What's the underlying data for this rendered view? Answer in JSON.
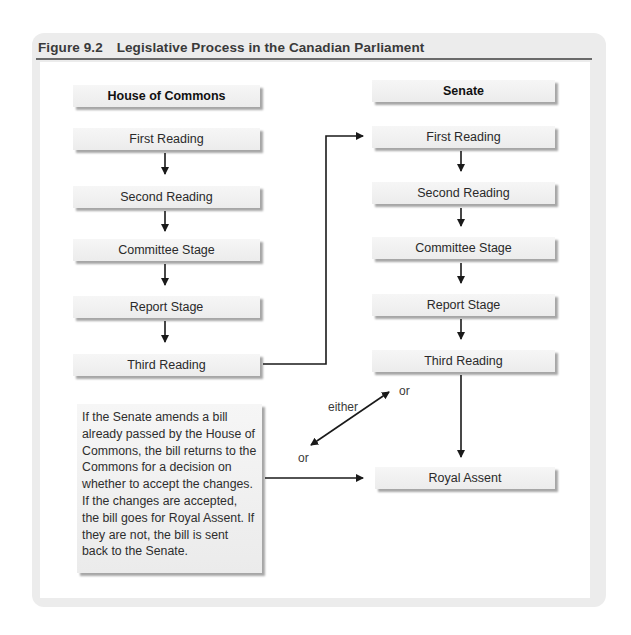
{
  "figure": {
    "number": "Figure 9.2",
    "title": "Legislative Process in the Canadian Parliament"
  },
  "columns": {
    "commons": {
      "header": "House of Commons",
      "steps": [
        "First Reading",
        "Second Reading",
        "Committee Stage",
        "Report Stage",
        "Third Reading"
      ]
    },
    "senate": {
      "header": "Senate",
      "steps": [
        "First Reading",
        "Second Reading",
        "Committee Stage",
        "Report Stage",
        "Third Reading"
      ],
      "final": "Royal Assent"
    }
  },
  "note": "If the Senate amends a bill already passed by the House of Commons, the bill returns to the Commons for a decision on whether to accept the changes. If the changes are accepted, the bill goes for Royal Assent. If they are not, the bill is sent back to the Senate.",
  "labels": {
    "either": "either",
    "or_upper": "or",
    "or_lower": "or"
  },
  "colors": {
    "frame": "#ececec",
    "box_fill": "#f2f2f2",
    "arrow": "#1a1a1a",
    "rule": "#6a6a6a"
  }
}
